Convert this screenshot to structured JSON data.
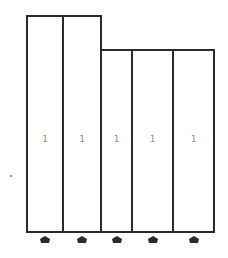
{
  "diagram": {
    "line_color": "#2b2b2b",
    "label_color": "#8a8a8a",
    "marker_color": "#2b2b2b",
    "columns": [
      {
        "label": "1",
        "left": 26,
        "right": 62,
        "top": 15
      },
      {
        "label": "1",
        "left": 62,
        "right": 100,
        "top": 15
      },
      {
        "label": "1",
        "left": 100,
        "right": 131,
        "top": 49
      },
      {
        "label": "1",
        "left": 131,
        "right": 172,
        "top": 49
      },
      {
        "label": "1",
        "left": 172,
        "right": 213,
        "top": 49
      }
    ],
    "bottom": 231,
    "marker_icon": "up-pentagon-marker"
  }
}
